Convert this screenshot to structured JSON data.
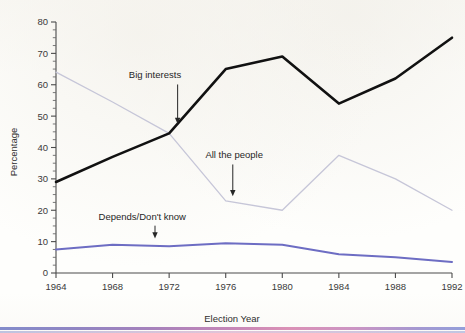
{
  "chart_data": {
    "type": "line",
    "title": "",
    "xlabel": "Election Year",
    "ylabel": "Percentage",
    "x": [
      1964,
      1968,
      1972,
      1976,
      1980,
      1984,
      1988,
      1992
    ],
    "categories": [
      "1964",
      "1968",
      "1972",
      "1976",
      "1980",
      "1984",
      "1988",
      "1992"
    ],
    "xlim": [
      1964,
      1992
    ],
    "ylim": [
      0,
      80
    ],
    "ytick_labels": [
      "0",
      "10",
      "20",
      "30",
      "40",
      "50",
      "60",
      "70",
      "80"
    ],
    "ytick_values": [
      0,
      10,
      20,
      30,
      40,
      50,
      60,
      70,
      80
    ],
    "yminor_step": 2.5,
    "grid": false,
    "legend_position": "none",
    "series": [
      {
        "name": "Big interests",
        "color": "#111111",
        "width": 2.6,
        "values": [
          29,
          37,
          44.5,
          65,
          69,
          54,
          62,
          75
        ]
      },
      {
        "name": "All the people",
        "color": "#c6c6d8",
        "width": 1.3,
        "values": [
          64,
          54.5,
          44.5,
          23,
          20,
          37.5,
          30,
          20
        ]
      },
      {
        "name": "Depends/Don't know",
        "color": "#6d6dc3",
        "width": 2.0,
        "values": [
          7.5,
          9,
          8.5,
          9.5,
          9,
          6,
          5,
          3.5
        ]
      }
    ],
    "annotations": [
      {
        "text": "Big interests",
        "target_series": "Big interests",
        "text_x": 1971.0,
        "text_y": 62.0,
        "point_x": 1972.6,
        "point_y": 47.5
      },
      {
        "text": "All the people",
        "target_series": "All the people",
        "text_x": 1976.6,
        "text_y": 36.5,
        "point_x": 1976.5,
        "point_y": 24.5
      },
      {
        "text": "Depends/Don't know",
        "target_series": "Depends/Don't know",
        "text_x": 1970.1,
        "text_y": 17.0,
        "point_x": 1971.0,
        "point_y": 11.0
      }
    ]
  },
  "page": {
    "paper_background": "#fdfdfb",
    "bottom_rule_colors": [
      "#7d86c8",
      "#bf7fb4",
      "#8e9ad8"
    ]
  }
}
